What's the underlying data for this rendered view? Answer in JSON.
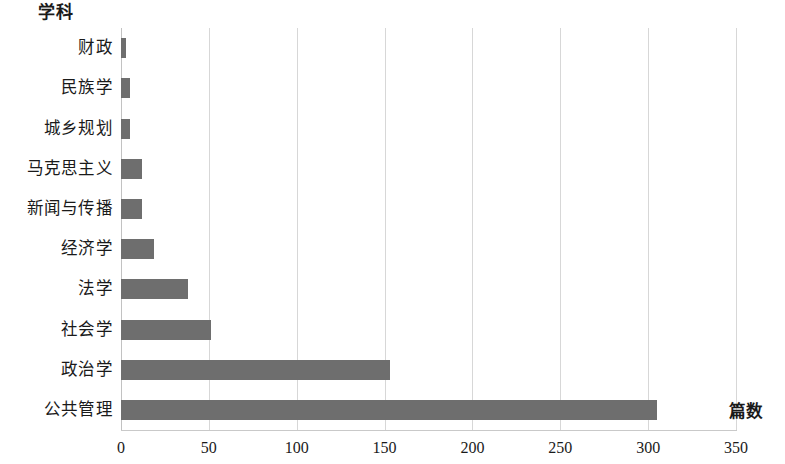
{
  "chart_data": {
    "type": "bar",
    "orientation": "horizontal",
    "title": "学科",
    "xlabel": "篇数",
    "ylabel": "",
    "categories": [
      "财政",
      "民族学",
      "城乡规划",
      "马克思主义",
      "新闻与传播",
      "经济学",
      "法学",
      "社会学",
      "政治学",
      "公共管理"
    ],
    "values": [
      3,
      5,
      5,
      12,
      12,
      19,
      38,
      51,
      153,
      305
    ],
    "xlim": [
      0,
      350
    ],
    "xticks": [
      0,
      50,
      100,
      150,
      200,
      250,
      300,
      350
    ],
    "xtick_labels": [
      "0",
      "50",
      "100",
      "150",
      "200",
      "250",
      "300",
      "350"
    ],
    "grid": "vertical",
    "legend": "none",
    "bar_color": "#6e6e6e",
    "gridline_color": "#d7d7d7",
    "axis_color": "#c2c2c2"
  }
}
